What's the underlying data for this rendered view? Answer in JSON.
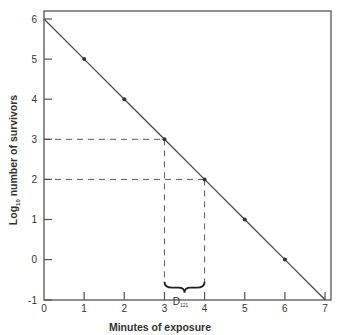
{
  "chart_data": {
    "type": "line",
    "title": "",
    "xlabel": "Minutes of exposure",
    "ylabel": "Log10 number of survivors",
    "ylabel_base": "Log",
    "ylabel_sub": "10",
    "ylabel_rest": " number of survivors",
    "xlim": [
      0,
      7
    ],
    "ylim": [
      -1,
      6
    ],
    "x_ticks": [
      0,
      1,
      2,
      3,
      4,
      5,
      6,
      7
    ],
    "y_ticks": [
      -1,
      0,
      1,
      2,
      3,
      4,
      5,
      6
    ],
    "grid": false,
    "legend": null,
    "series": [
      {
        "name": "Survivor curve",
        "x": [
          0,
          1,
          2,
          3,
          4,
          5,
          6,
          7
        ],
        "y": [
          6,
          5,
          4,
          3,
          2,
          1,
          0,
          -1
        ],
        "markers_at": [
          1,
          2,
          3,
          4,
          5,
          6
        ]
      }
    ],
    "annotations": [
      {
        "type": "dashed-guide",
        "from": [
          0,
          3
        ],
        "to": [
          3,
          3
        ],
        "down_to": -0.6
      },
      {
        "type": "dashed-guide",
        "from": [
          0,
          2
        ],
        "to": [
          4,
          2
        ],
        "down_to": -0.6
      },
      {
        "type": "brace",
        "x_range": [
          3,
          4
        ],
        "label": "D",
        "label_sub": "121"
      }
    ]
  },
  "colors": {
    "line": "#4a4a4a",
    "axis": "#555555",
    "text": "#333333",
    "background": "#ffffff"
  }
}
